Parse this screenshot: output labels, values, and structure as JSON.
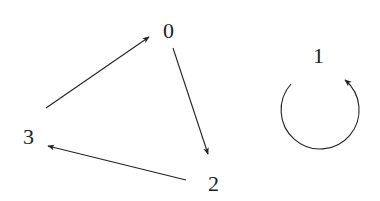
{
  "diagram": {
    "type": "directed-graph",
    "colors": {
      "stroke": "#222222",
      "text": "#222222",
      "background": "#ffffff"
    },
    "nodes": [
      {
        "id": "0",
        "label": "0",
        "x": 170,
        "y": 30
      },
      {
        "id": "1",
        "label": "1",
        "x": 320,
        "y": 55
      },
      {
        "id": "2",
        "label": "2",
        "x": 215,
        "y": 183
      },
      {
        "id": "3",
        "label": "3",
        "x": 30,
        "y": 136
      }
    ],
    "edges": [
      {
        "from": "3",
        "to": "0"
      },
      {
        "from": "0",
        "to": "2"
      },
      {
        "from": "2",
        "to": "3"
      },
      {
        "from": "1",
        "to": "1",
        "self_loop": true
      }
    ]
  }
}
